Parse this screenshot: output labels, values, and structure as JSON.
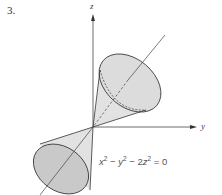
{
  "figure": {
    "problem_number": "3.",
    "axes": {
      "z": "z",
      "y": "y"
    },
    "equation": {
      "parts": [
        "x",
        "2",
        " − ",
        "y",
        "2",
        " − 2",
        "z",
        "2",
        " = 0"
      ],
      "text": "x² − y² − 2z² = 0"
    },
    "colors": {
      "cone_fill": "#dedede",
      "cone_base_fill": "#c9c9c9",
      "stroke": "#333333"
    }
  }
}
